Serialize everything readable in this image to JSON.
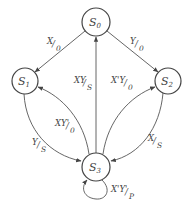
{
  "diagram": {
    "type": "state-diagram",
    "colors": {
      "stroke": "#444444",
      "text": "#444444",
      "background": "#ffffff"
    },
    "nodes": [
      {
        "id": "S0",
        "main": "S",
        "sub": "0",
        "cx": 96,
        "cy": 22,
        "r": 14
      },
      {
        "id": "S1",
        "main": "S",
        "sub": "1",
        "cx": 25,
        "cy": 81,
        "r": 13
      },
      {
        "id": "S2",
        "main": "S",
        "sub": "2",
        "cx": 168,
        "cy": 81,
        "r": 13
      },
      {
        "id": "S3",
        "main": "S",
        "sub": "3",
        "cx": 96,
        "cy": 167,
        "r": 14
      }
    ],
    "edges": [
      {
        "from": "S0",
        "to": "S1",
        "input": "X",
        "output": "0",
        "label": "X/0"
      },
      {
        "from": "S0",
        "to": "S2",
        "input": "Y",
        "output": "0",
        "label": "Y/0"
      },
      {
        "from": "S3",
        "to": "S0",
        "input": "XY",
        "output": "S",
        "label": "XY/S"
      },
      {
        "from": "S3",
        "to": "S1",
        "input": "XY'",
        "output": "0",
        "label": "XY'/0"
      },
      {
        "from": "S1",
        "to": "S3",
        "input": "Y",
        "output": "S",
        "label": "Y/S"
      },
      {
        "from": "S3",
        "to": "S2",
        "input": "X'Y",
        "output": "0",
        "label": "X'Y/0"
      },
      {
        "from": "S2",
        "to": "S3",
        "input": "X",
        "output": "S",
        "label": "X/S"
      },
      {
        "from": "S3",
        "to": "S3",
        "input": "X'Y'",
        "output": "P",
        "label": "X'Y'/P"
      }
    ]
  }
}
